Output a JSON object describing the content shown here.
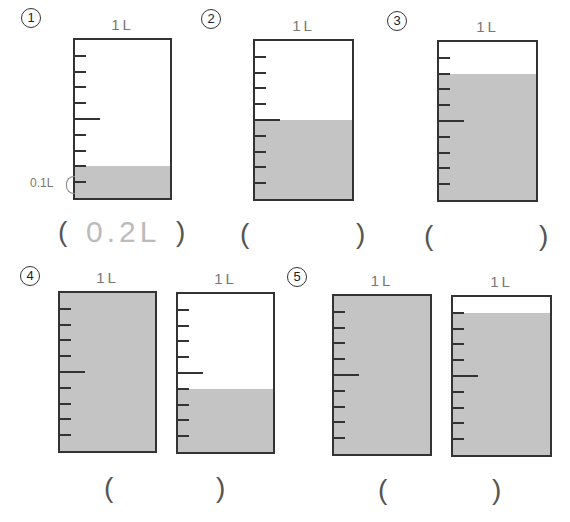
{
  "problems": [
    {
      "number": "1",
      "beakers": [
        {
          "label": "1L",
          "x": 73,
          "y": 38,
          "w": 99,
          "h": 162,
          "fill_fraction": 0.2
        }
      ],
      "answer": "0.2L",
      "scale_label": "0.1L",
      "num_pos": [
        21,
        8
      ],
      "paren_left": [
        58,
        218
      ],
      "paren_right": [
        176,
        218
      ],
      "answer_pos": [
        86,
        217
      ]
    },
    {
      "number": "2",
      "beakers": [
        {
          "label": "1L",
          "x": 253,
          "y": 39,
          "w": 101,
          "h": 162,
          "fill_fraction": 0.5
        }
      ],
      "answer": "",
      "num_pos": [
        201,
        9
      ],
      "paren_left": [
        240,
        220
      ],
      "paren_right": [
        356,
        220
      ]
    },
    {
      "number": "3",
      "beakers": [
        {
          "label": "1L",
          "x": 437,
          "y": 40,
          "w": 101,
          "h": 162,
          "fill_fraction": 0.8
        }
      ],
      "answer": "",
      "num_pos": [
        387,
        11
      ],
      "paren_left": [
        424,
        222
      ],
      "paren_right": [
        539,
        222
      ]
    },
    {
      "number": "4",
      "beakers": [
        {
          "label": "1L",
          "x": 58,
          "y": 291,
          "w": 99,
          "h": 162,
          "fill_fraction": 1.0
        },
        {
          "label": "1L",
          "x": 176,
          "y": 292,
          "w": 99,
          "h": 162,
          "fill_fraction": 0.4
        }
      ],
      "answer": "",
      "num_pos": [
        20,
        266
      ],
      "paren_left": [
        104,
        474
      ],
      "paren_right": [
        216,
        474
      ]
    },
    {
      "number": "5",
      "beakers": [
        {
          "label": "1L",
          "x": 332,
          "y": 294,
          "w": 100,
          "h": 162,
          "fill_fraction": 1.0
        },
        {
          "label": "1L",
          "x": 451,
          "y": 295,
          "w": 101,
          "h": 162,
          "fill_fraction": 0.9
        }
      ],
      "answer": "",
      "num_pos": [
        287,
        267
      ],
      "paren_left": [
        378,
        476
      ],
      "paren_right": [
        492,
        476
      ]
    }
  ],
  "paren_open": "(",
  "paren_close": ")",
  "colors": {
    "liquid": "#c4c4c4",
    "border": "#333333",
    "answer_text": "#bbbbbb"
  }
}
